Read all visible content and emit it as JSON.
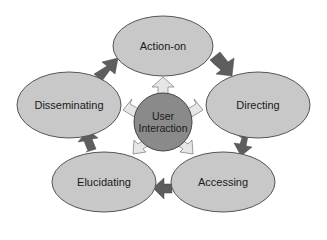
{
  "diagram": {
    "center": {
      "label_line1": "User",
      "label_line2": "Interaction",
      "fill": "#8a8a8a"
    },
    "nodes": [
      {
        "id": "action-on",
        "label": "Action-on"
      },
      {
        "id": "directing",
        "label": "Directing"
      },
      {
        "id": "accessing",
        "label": "Accessing"
      },
      {
        "id": "elucidating",
        "label": "Elucidating"
      },
      {
        "id": "disseminating",
        "label": "Disseminating"
      }
    ],
    "colors": {
      "node_fill": "#c8c8c8",
      "node_stroke": "#555555",
      "cycle_arrow": "#5e5e5e",
      "radial_arrow": "#e6e6e6"
    },
    "edges": [
      {
        "from": "Action-on",
        "to": "Directing"
      },
      {
        "from": "Directing",
        "to": "Accessing"
      },
      {
        "from": "Accessing",
        "to": "Elucidating"
      },
      {
        "from": "Elucidating",
        "to": "Disseminating"
      },
      {
        "from": "Disseminating",
        "to": "Action-on"
      }
    ]
  }
}
